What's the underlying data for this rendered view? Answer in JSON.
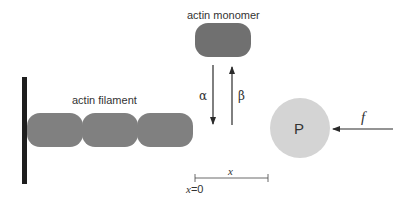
{
  "diagram": {
    "labels": {
      "filament": "actin filament",
      "monomer": "actin monomer",
      "on_rate": "α",
      "off_rate": "β",
      "particle": "P",
      "force": "f",
      "distance": "x",
      "origin": "x=0"
    },
    "colors": {
      "wall": "#1e1e1e",
      "actin": "#808080",
      "monomer": "#707070",
      "particle": "#d4d4d4",
      "arrow": "#2a2a2a",
      "text": "#333333"
    },
    "filament_subunit_count": 3
  }
}
